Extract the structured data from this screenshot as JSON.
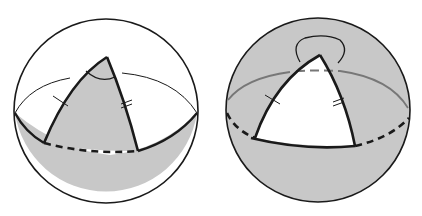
{
  "figure": {
    "description": "Two spheres each showing a spherical triangle bounded by great-circle arcs meeting the equator",
    "colors": {
      "background": "#ffffff",
      "shade": "#c8c8c8",
      "stroke": "#1a1a1a",
      "hidden_line": "#777777"
    },
    "spheres": [
      {
        "id": "left",
        "center": [
          106,
          111
        ],
        "radius": 92,
        "triangle_fill": "shaded",
        "apex": [
          107,
          57
        ],
        "base_left": [
          44,
          143
        ],
        "base_right": [
          138,
          151
        ],
        "equator_front": "solid",
        "equator_triangle_base": "dashed",
        "angle_mark": "interior arc at apex",
        "tick_marks": {
          "left_side": 1,
          "right_side": 2
        }
      },
      {
        "id": "right",
        "center": [
          318,
          110
        ],
        "radius": 92,
        "triangle_fill": "white (complement shaded)",
        "apex": [
          320,
          55
        ],
        "base_left": [
          255,
          138
        ],
        "base_right": [
          355,
          146
        ],
        "equator_front": "dashed",
        "equator_triangle_base": "solid",
        "angle_mark": "exterior loop at apex",
        "tick_marks": {
          "left_side": 1,
          "right_side": 2
        }
      }
    ]
  }
}
